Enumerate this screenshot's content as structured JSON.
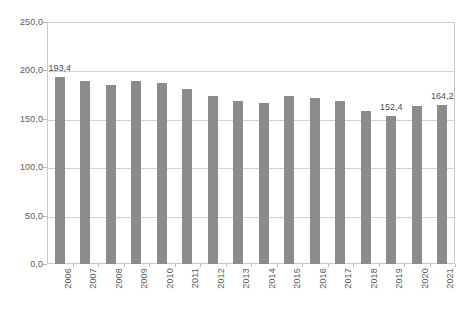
{
  "chart_data": {
    "type": "bar",
    "title": "",
    "xlabel": "",
    "ylabel": "",
    "categories": [
      "2006",
      "2007",
      "2008",
      "2009",
      "2010",
      "2011",
      "2012",
      "2013",
      "2014",
      "2015",
      "2016",
      "2017",
      "2018",
      "2019",
      "2020",
      "2021"
    ],
    "values": [
      193.4,
      189.0,
      184.6,
      189.0,
      187.4,
      181.0,
      174.0,
      168.2,
      166.2,
      174.0,
      171.0,
      168.0,
      157.6,
      152.4,
      163.0,
      164.2
    ],
    "value_labels": [
      "193,4",
      "",
      "",
      "",
      "",
      "",
      "",
      "",
      "",
      "",
      "",
      "",
      "",
      "152,4",
      "",
      "164,2"
    ],
    "series": [
      {
        "name": "",
        "values": [
          193.4,
          189.0,
          184.6,
          189.0,
          187.4,
          181.0,
          174.0,
          168.2,
          166.2,
          174.0,
          171.0,
          168.0,
          157.6,
          152.4,
          163.0,
          164.2
        ]
      }
    ],
    "ylim": [
      0,
      250
    ],
    "ytick_step": 50,
    "ytick_labels": [
      "250,0",
      "200,0",
      "150,0",
      "100,0",
      "50,0",
      "0,0"
    ],
    "ytick_values": [
      250,
      200,
      150,
      100,
      50,
      0
    ],
    "grid": true,
    "grid_axis": "y",
    "legend": "none",
    "bar_color": "#8c8c8c",
    "plot_border_color": "#c9c9c9",
    "gridline_color": "#d2d2d2",
    "text_color": "#5a5a5a",
    "decimal_separator": ","
  }
}
